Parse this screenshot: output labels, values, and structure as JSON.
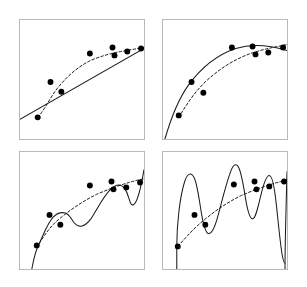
{
  "figure": {
    "title": "",
    "background_color": "#ffffff",
    "frame_color": "#b9b9b9",
    "curve_color": "#1a1a1a",
    "point_color": "#000000",
    "panel_count": 4,
    "grid_rows": 2,
    "grid_cols": 2
  },
  "chart_data": {
    "type": "scatter",
    "title": "",
    "xlabel": "",
    "ylabel": "",
    "xlim": [
      0,
      1
    ],
    "ylim": [
      0,
      1
    ],
    "grid": false,
    "legend": "none",
    "axis_ticks": "none",
    "shared_points_note": "Identical eight observations plotted in all four panels",
    "points": {
      "x": [
        0.14,
        0.25,
        0.34,
        0.57,
        0.75,
        0.77,
        0.88,
        1.0
      ],
      "y": [
        0.08,
        0.46,
        0.38,
        0.68,
        0.78,
        0.72,
        0.74,
        0.77
      ]
    },
    "series": [
      {
        "name": "panel-1-solid-fit",
        "panel": 1,
        "style": "solid",
        "label": "degree-1 fit",
        "x": [
          0.0,
          0.25,
          0.5,
          0.75,
          1.0
        ],
        "y": [
          0.18,
          0.37,
          0.56,
          0.75,
          0.93
        ]
      },
      {
        "name": "panel-1-dashed-fit",
        "panel": 1,
        "style": "dashed",
        "label": "reference curve",
        "x": [
          0.14,
          0.25,
          0.4,
          0.55,
          0.7,
          0.85,
          1.0
        ],
        "y": [
          0.08,
          0.44,
          0.56,
          0.65,
          0.72,
          0.77,
          0.82
        ]
      },
      {
        "name": "panel-2-solid-fit",
        "panel": 2,
        "style": "solid",
        "label": "degree-2 fit",
        "x": [
          0.0,
          0.2,
          0.4,
          0.6,
          0.8,
          1.0
        ],
        "y": [
          0.0,
          0.42,
          0.64,
          0.76,
          0.79,
          0.75
        ]
      },
      {
        "name": "panel-2-dashed-fit",
        "panel": 2,
        "style": "dashed",
        "label": "reference curve",
        "x": [
          0.1,
          0.3,
          0.5,
          0.7,
          0.85,
          1.0
        ],
        "y": [
          0.1,
          0.46,
          0.63,
          0.73,
          0.79,
          0.84
        ]
      },
      {
        "name": "panel-3-solid-fit",
        "panel": 3,
        "style": "solid",
        "label": "degree-5 fit",
        "x": [
          0.06,
          0.14,
          0.22,
          0.34,
          0.5,
          0.62,
          0.72,
          0.8,
          0.88,
          0.95,
          1.0
        ],
        "y": [
          -0.15,
          0.12,
          0.42,
          0.44,
          0.62,
          0.76,
          0.78,
          0.66,
          0.64,
          0.78,
          1.05
        ]
      },
      {
        "name": "panel-3-dashed-fit",
        "panel": 3,
        "style": "dashed",
        "label": "reference curve",
        "x": [
          0.14,
          0.3,
          0.5,
          0.7,
          0.85,
          1.0
        ],
        "y": [
          0.08,
          0.4,
          0.6,
          0.72,
          0.78,
          0.82
        ]
      },
      {
        "name": "panel-4-solid-fit",
        "panel": 4,
        "style": "solid",
        "label": "degree-9 fit",
        "x": [
          0.13,
          0.16,
          0.22,
          0.28,
          0.34,
          0.4,
          0.48,
          0.56,
          0.62,
          0.68,
          0.74,
          0.8,
          0.86,
          0.92,
          0.97,
          1.0
        ],
        "y": [
          -0.3,
          0.45,
          0.9,
          0.55,
          0.3,
          0.42,
          0.95,
          1.08,
          0.62,
          0.42,
          0.7,
          0.95,
          0.72,
          0.05,
          0.5,
          1.1
        ]
      },
      {
        "name": "panel-4-dashed-fit",
        "panel": 4,
        "style": "dashed",
        "label": "reference curve",
        "x": [
          0.14,
          0.3,
          0.5,
          0.7,
          0.85,
          1.0
        ],
        "y": [
          0.08,
          0.4,
          0.6,
          0.72,
          0.78,
          0.82
        ]
      }
    ]
  },
  "panels": [
    {
      "id": "panel-1",
      "name": "top-left-panel",
      "caption": "",
      "position": {
        "left": 19,
        "top": 19,
        "width": 126,
        "height": 121
      }
    },
    {
      "id": "panel-2",
      "name": "top-right-panel",
      "caption": "",
      "position": {
        "left": 162,
        "top": 19,
        "width": 126,
        "height": 121
      }
    },
    {
      "id": "panel-3",
      "name": "bottom-left-panel",
      "caption": "",
      "position": {
        "left": 19,
        "top": 151,
        "width": 126,
        "height": 119
      }
    },
    {
      "id": "panel-4",
      "name": "bottom-right-panel",
      "caption": "",
      "position": {
        "left": 162,
        "top": 151,
        "width": 126,
        "height": 119
      }
    }
  ]
}
